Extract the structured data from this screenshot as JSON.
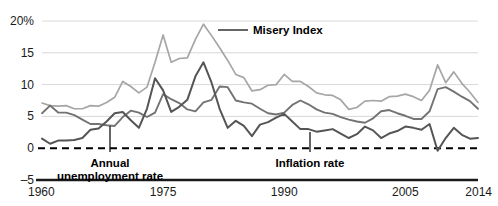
{
  "chart_data": {
    "type": "line",
    "title": "",
    "xlabel": "",
    "ylabel": "",
    "xlim": [
      1960,
      2014
    ],
    "ylim": [
      -5,
      20
    ],
    "yticks": [
      -5,
      0,
      5,
      10,
      15,
      20
    ],
    "ytick_labels": [
      "–5",
      "0",
      "5",
      "10",
      "15",
      "20%"
    ],
    "xticks": [
      1960,
      1975,
      1990,
      2005,
      2014
    ],
    "xtick_labels": [
      "1960",
      "1975",
      "1990",
      "2005",
      "2014"
    ],
    "grid": "horizontal",
    "legend": "inline-annotations",
    "zero_reference_line": true,
    "x": [
      1960,
      1961,
      1962,
      1963,
      1964,
      1965,
      1966,
      1967,
      1968,
      1969,
      1970,
      1971,
      1972,
      1973,
      1974,
      1975,
      1976,
      1977,
      1978,
      1979,
      1980,
      1981,
      1982,
      1983,
      1984,
      1985,
      1986,
      1987,
      1988,
      1989,
      1990,
      1991,
      1992,
      1993,
      1994,
      1995,
      1996,
      1997,
      1998,
      1999,
      2000,
      2001,
      2002,
      2003,
      2004,
      2005,
      2006,
      2007,
      2008,
      2009,
      2010,
      2011,
      2012,
      2013,
      2014
    ],
    "series": [
      {
        "name": "Misery Index",
        "color": "#a6a6a6",
        "values": [
          7.1,
          6.7,
          6.6,
          6.7,
          6.2,
          6.2,
          6.7,
          6.6,
          7.2,
          8.0,
          10.5,
          9.7,
          8.7,
          9.6,
          13.5,
          17.8,
          13.5,
          14.1,
          14.2,
          17.1,
          19.5,
          17.7,
          15.8,
          13.8,
          11.6,
          11.1,
          9.0,
          9.2,
          9.9,
          10.0,
          11.6,
          10.5,
          10.5,
          9.7,
          8.7,
          8.4,
          8.3,
          7.6,
          6.1,
          6.4,
          7.4,
          7.5,
          7.4,
          8.1,
          8.2,
          8.5,
          8.1,
          7.5,
          9.1,
          13.1,
          10.3,
          12.0,
          10.2,
          8.8,
          7.2
        ]
      },
      {
        "name": "Annual unemployment rate",
        "color": "#737373",
        "values": [
          5.5,
          6.7,
          5.6,
          5.6,
          5.2,
          4.5,
          3.8,
          3.8,
          3.6,
          3.5,
          4.9,
          5.9,
          5.6,
          4.9,
          5.6,
          8.5,
          7.7,
          7.1,
          6.1,
          5.8,
          7.2,
          7.6,
          9.7,
          9.6,
          7.5,
          7.2,
          7.0,
          6.2,
          5.5,
          5.3,
          5.6,
          6.8,
          7.5,
          6.9,
          6.1,
          5.6,
          5.4,
          4.9,
          4.5,
          4.2,
          4.0,
          4.7,
          5.8,
          6.0,
          5.5,
          5.1,
          4.6,
          4.6,
          5.8,
          9.3,
          9.6,
          8.9,
          8.1,
          7.4,
          6.2
        ]
      },
      {
        "name": "Inflation rate",
        "color": "#555555",
        "values": [
          1.5,
          0.7,
          1.2,
          1.2,
          1.3,
          1.6,
          2.9,
          3.1,
          4.2,
          5.5,
          5.7,
          4.4,
          3.2,
          6.2,
          11.0,
          9.1,
          5.7,
          6.5,
          7.6,
          11.3,
          13.5,
          10.3,
          6.2,
          3.2,
          4.3,
          3.5,
          1.9,
          3.7,
          4.1,
          4.8,
          5.4,
          4.2,
          3.0,
          3.0,
          2.6,
          2.8,
          3.0,
          2.3,
          1.6,
          2.2,
          3.4,
          2.8,
          1.6,
          2.3,
          2.7,
          3.4,
          3.2,
          2.9,
          3.8,
          -0.4,
          1.6,
          3.2,
          2.1,
          1.5,
          1.6
        ]
      }
    ],
    "annotations": [
      {
        "name": "misery-index-label",
        "text": "Misery Index",
        "label_x": 253,
        "label_y": 34,
        "leader": [
          [
            218,
            30
          ],
          [
            248,
            30
          ]
        ]
      },
      {
        "name": "unemployment-label",
        "text_line1": "Annual",
        "text_line2": "unemployment rate",
        "label_x": 110,
        "label_y": 167,
        "leader": [
          [
            110,
            126
          ],
          [
            110,
            152
          ]
        ]
      },
      {
        "name": "inflation-label",
        "text": "Inflation rate",
        "label_x": 310,
        "label_y": 167,
        "leader": [
          [
            310,
            132
          ],
          [
            310,
            152
          ]
        ]
      }
    ]
  }
}
